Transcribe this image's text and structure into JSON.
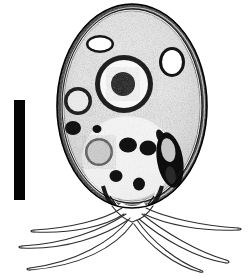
{
  "figure": {
    "kind": "scientific-micrograph",
    "width": 251,
    "height": 277,
    "background_color": "#ffffff",
    "ink_color": "#000000",
    "caption_text": ""
  },
  "scale_bar": {
    "label": "",
    "color": "#050505",
    "x": 14,
    "y": 100,
    "width": 11,
    "height": 100,
    "orientation": "vertical"
  },
  "cell_body": {
    "name": "ovoid cell body",
    "center_x": 132,
    "center_y": 106,
    "radius_x": 75,
    "radius_y": 102,
    "wall_color": "#141414",
    "wall_thickness": 7,
    "cytoplasm_color": "#f2f2f2"
  },
  "nucleus": {
    "name": "nucleus",
    "center_x": 124,
    "center_y": 84,
    "outer_radius": 28,
    "ring_color": "#111111",
    "ring_thickness": 5,
    "annulus_color": "#fbfbfb",
    "nucleolus_radius": 11,
    "nucleolus_color": "#1a1a1a"
  },
  "vacuoles": [
    {
      "name": "upper-left vacuole",
      "cx": 100,
      "cy": 44,
      "rx": 12,
      "ry": 7,
      "fill": "#ffffff",
      "rim": "#141414"
    },
    {
      "name": "upper-right vacuole",
      "cx": 172,
      "cy": 62,
      "rx": 10,
      "ry": 12,
      "fill": "#ffffff",
      "rim": "#141414"
    },
    {
      "name": "left small vesicle",
      "cx": 78,
      "cy": 100,
      "rx": 12,
      "ry": 13,
      "fill": "#efefef",
      "rim": "#151515"
    },
    {
      "name": "mid-left granular vesicle",
      "cx": 99,
      "cy": 152,
      "rx": 13,
      "ry": 13,
      "fill": "#dcdcdc",
      "rim": "#2a2a2a"
    }
  ],
  "granules": [
    {
      "name": "granule-1",
      "cx": 73,
      "cy": 128,
      "rx": 7,
      "ry": 6
    },
    {
      "name": "granule-2",
      "cx": 97,
      "cy": 129,
      "rx": 4,
      "ry": 4
    },
    {
      "name": "granule-3",
      "cx": 128,
      "cy": 145,
      "rx": 8,
      "ry": 7
    },
    {
      "name": "granule-4",
      "cx": 148,
      "cy": 148,
      "rx": 8,
      "ry": 7
    },
    {
      "name": "granule-5",
      "cx": 116,
      "cy": 176,
      "rx": 6,
      "ry": 6
    },
    {
      "name": "granule-6",
      "cx": 139,
      "cy": 184,
      "rx": 6,
      "ry": 6
    },
    {
      "name": "granule-7",
      "cx": 160,
      "cy": 138,
      "rx": 4,
      "ry": 7
    }
  ],
  "elongate_body": {
    "name": "elongate dark inclusion",
    "cx": 170,
    "cy": 160,
    "rx": 11,
    "ry": 26,
    "rotation": -12,
    "fill": "#101010"
  },
  "neck": {
    "name": "basal neck opening",
    "left_x": 110,
    "right_x": 155,
    "y": 205
  },
  "filaments": [
    {
      "name": "filament-left-upper",
      "path": "M 118 210 C 100 222 62 228 32 232"
    },
    {
      "name": "filament-left-mid",
      "path": "M 122 214 C 96 232 58 244 22 248"
    },
    {
      "name": "filament-left-lower",
      "path": "M 126 218 C 104 244 72 262 28 270"
    },
    {
      "name": "filament-right-upper",
      "path": "M 146 212 C 170 222 206 228 238 230"
    },
    {
      "name": "filament-right-mid",
      "path": "M 142 216 C 168 236 200 254 228 264"
    },
    {
      "name": "filament-right-lower",
      "path": "M 138 219 C 156 242 182 262 202 272"
    }
  ]
}
